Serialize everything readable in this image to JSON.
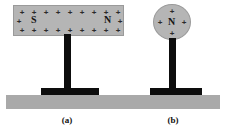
{
  "figure": {
    "background_color": "#ffffff",
    "ground_color": "#a9a9a9",
    "stand_color": "#0d0d0d",
    "magnet_fill_color": "#b5b5b5",
    "charge_symbol": "+"
  },
  "panels": [
    {
      "id": "a",
      "caption": "(a)",
      "magnet_shape": "bar",
      "poles": [
        {
          "label": "S",
          "position": "left"
        },
        {
          "label": "N",
          "position": "right"
        }
      ],
      "charge_symbol": "+",
      "charge_rows": [
        {
          "row": "top",
          "count": 9
        },
        {
          "row": "middle",
          "count": 2
        },
        {
          "row": "bottom",
          "count": 9
        }
      ],
      "charge_positions_top": [
        20,
        32,
        44,
        56,
        68,
        80,
        92,
        104,
        115
      ],
      "charge_positions_middle": [
        17,
        118
      ],
      "charge_positions_bottom": [
        20,
        32,
        44,
        56,
        68,
        80,
        92,
        104,
        115
      ]
    },
    {
      "id": "b",
      "caption": "(b)",
      "magnet_shape": "disc",
      "poles": [
        {
          "label": "N",
          "position": "center"
        }
      ],
      "charge_symbol": "+",
      "charge_rows": [
        {
          "row": "top",
          "count": 1
        },
        {
          "row": "middle",
          "count": 2
        },
        {
          "row": "bottom",
          "count": 1
        }
      ],
      "charge_positions": [
        {
          "x": 169,
          "y": 8
        },
        {
          "x": 157,
          "y": 19
        },
        {
          "x": 182,
          "y": 19
        },
        {
          "x": 169,
          "y": 31
        }
      ]
    }
  ]
}
